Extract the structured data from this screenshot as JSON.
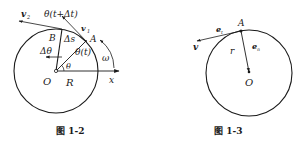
{
  "figures": [
    {
      "id": "fig-1-2",
      "caption": "图 1-2",
      "labels": {
        "v2": "v",
        "v2_sub": "2",
        "theta_t_dt": "θ(t+Δt)",
        "v1": "v",
        "v1_sub": "1",
        "point_a": "A",
        "point_b": "B",
        "delta_s": "Δs",
        "delta_theta": "Δθ",
        "theta_t": "θ(t)",
        "omega": "ω",
        "theta": "θ",
        "origin": "O",
        "radius": "R",
        "x_axis": "x"
      }
    },
    {
      "id": "fig-1-3",
      "caption": "图 1-3",
      "labels": {
        "point_a": "A",
        "e_t": "e",
        "e_t_sub": "t",
        "velocity": "v",
        "radius": "r",
        "e_n": "e",
        "e_n_sub": "n",
        "origin": "O"
      }
    }
  ],
  "colors": {
    "ink": "#1a1a1a",
    "background": "#ffffff"
  }
}
